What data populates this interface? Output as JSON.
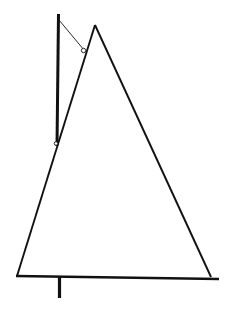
{
  "figure": {
    "canvas": {
      "width": 232,
      "height": 313,
      "background": "#ffffff"
    },
    "ink_color": "#111111",
    "strokes": {
      "mast": {
        "name": "vertical-mast",
        "x1": 58.5,
        "y1": 14,
        "x2": 57.0,
        "y2": 146,
        "width": 3.0,
        "color": "#111111"
      },
      "sail_left_edge": {
        "name": "sail-left-leech",
        "x1": 95,
        "y1": 25,
        "x2": 17,
        "y2": 276,
        "width": 1.9,
        "color": "#111111"
      },
      "sail_right_edge": {
        "name": "sail-right-leech",
        "x1": 95,
        "y1": 25,
        "x2": 211,
        "y2": 277,
        "width": 1.9,
        "color": "#111111"
      },
      "baseline": {
        "name": "boom-baseline",
        "x1": 16,
        "y1": 276,
        "x2": 219,
        "y2": 279,
        "width": 2.6,
        "color": "#111111"
      },
      "halyard": {
        "name": "halyard-thin-line",
        "x1": 59,
        "y1": 20,
        "x2": 84,
        "y2": 50,
        "width": 0.9,
        "color": "#111111"
      },
      "keel_stub": {
        "name": "keel-stub",
        "x1": 59.5,
        "y1": 277,
        "x2": 59.5,
        "y2": 298,
        "width": 3.2,
        "color": "#111111"
      }
    },
    "markers": {
      "halyard_ring": {
        "name": "halyard-ring-marker",
        "cx": 83.5,
        "cy": 50.5,
        "r": 2.2,
        "stroke_width": 0.9,
        "color": "#111111"
      },
      "mast_foot": {
        "name": "mast-foot-marker",
        "cx": 56.0,
        "cy": 143.5,
        "r": 1.8,
        "stroke_width": 0.9,
        "color": "#111111"
      }
    }
  }
}
